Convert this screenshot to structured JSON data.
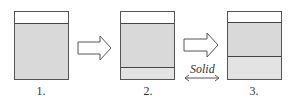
{
  "diagram": {
    "stages": [
      {
        "label": "1.",
        "layers": [
          "empty",
          "liquid"
        ]
      },
      {
        "label": "2.",
        "layers": [
          "empty",
          "liquid",
          "solid"
        ]
      },
      {
        "label": "3.",
        "layers": [
          "empty",
          "liquid",
          "solid"
        ]
      }
    ],
    "arrows": [
      "right-arrow-1",
      "right-arrow-2"
    ],
    "annotation": {
      "text": "Solid",
      "icon": "double-arrow-icon"
    },
    "colors": {
      "liquid": "#d9d9d9",
      "solid": "#e3e3e3",
      "border": "#555555"
    }
  }
}
